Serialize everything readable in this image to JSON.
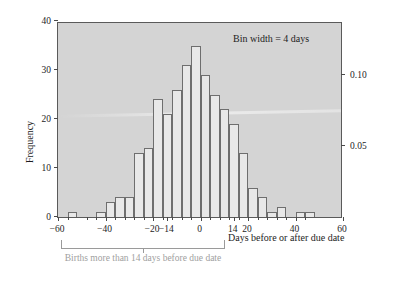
{
  "chart_data": {
    "type": "bar",
    "title": "",
    "subtitle": "",
    "xlabel": "Days before or after due date",
    "ylabel": "Frequency",
    "ylabel_secondary": "Relative frequency",
    "grid": false,
    "legend": null,
    "xlim": [
      -60,
      60
    ],
    "ylim": [
      0,
      40
    ],
    "ylim_secondary": [
      0,
      0.1379
    ],
    "bin_width": 4,
    "annotations": [
      {
        "text": "Bin width = 4 days",
        "x": 30,
        "y": 37
      },
      {
        "text": "Births more than 14 days before due date",
        "x": -37,
        "y": -8
      }
    ],
    "xticks": [
      -60,
      -40,
      -20,
      -14,
      0,
      14,
      20,
      40,
      60
    ],
    "xtick_labels": [
      "−60",
      "−40",
      "−20",
      "−14",
      "0",
      "14",
      "20",
      "40",
      "60"
    ],
    "yticks": [
      0,
      10,
      20,
      30,
      40
    ],
    "ytick_labels": [
      "0",
      "10",
      "20",
      "30",
      "40"
    ],
    "yticks_secondary": [
      0.05,
      0.1
    ],
    "ytick_labels_secondary": [
      "0.05",
      "0.10"
    ],
    "bin_left_edges": [
      -56,
      -48,
      -44,
      -40,
      -36,
      -32,
      -28,
      -24,
      -20,
      -16,
      -12,
      -8,
      -4,
      0,
      4,
      8,
      12,
      16,
      20,
      24,
      28,
      32,
      36,
      40,
      44
    ],
    "categories": [
      -54,
      -46,
      -42,
      -38,
      -34,
      -30,
      -26,
      -22,
      -18,
      -14,
      -10,
      -6,
      -2,
      2,
      6,
      10,
      14,
      18,
      22,
      26,
      30,
      34,
      38,
      42,
      46
    ],
    "values": [
      1,
      0,
      1,
      3,
      4,
      4,
      13,
      14,
      24,
      21,
      26,
      31,
      35,
      29,
      25,
      22,
      19,
      13,
      6,
      4,
      1,
      2,
      0,
      1,
      1
    ],
    "relative_values": [
      0.0034,
      0,
      0.0034,
      0.0103,
      0.0138,
      0.0138,
      0.0448,
      0.0483,
      0.0828,
      0.0724,
      0.0897,
      0.1069,
      0.1207,
      0.1,
      0.0862,
      0.0759,
      0.0655,
      0.0448,
      0.0207,
      0.0138,
      0.0034,
      0.0069,
      0,
      0.0034,
      0.0034
    ],
    "colors": {
      "bar_fill": "#e8e8e8",
      "bar_edge": "#6e6e6e",
      "plot_background": "#d4d4d4",
      "frame": "#5a5a5a",
      "text": "#1d1d1d",
      "annotation_gray": "#a0a0a0",
      "page_background": "#ffffff"
    }
  }
}
